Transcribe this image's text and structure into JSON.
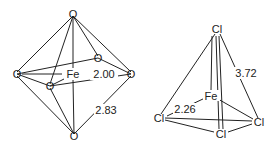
{
  "octahedron": {
    "center": "Fe",
    "ligand": "O",
    "bond_fe_o": "2.00",
    "edge_o_o": "2.83"
  },
  "tetrahedron": {
    "center": "Fe",
    "ligand": "Cl",
    "bond_fe_cl": "2.26",
    "edge_cl_cl": "3.72"
  }
}
